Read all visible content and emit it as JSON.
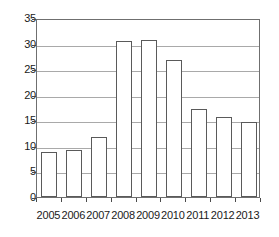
{
  "chart_data": {
    "type": "bar",
    "title": "",
    "subtitle": "",
    "xlabel": "",
    "ylabel": "",
    "categories": [
      "2005",
      "2006",
      "2007",
      "2008",
      "2009",
      "2010",
      "2011",
      "2012",
      "2013"
    ],
    "values": [
      8.8,
      9.2,
      11.7,
      30.5,
      30.7,
      26.7,
      17.2,
      15.6,
      14.6
    ],
    "ylim": [
      0,
      35
    ],
    "yticks": [
      0,
      5,
      10,
      15,
      20,
      25,
      30,
      35
    ],
    "ytick_labels": [
      "0",
      "5",
      "10",
      "15",
      "20",
      "25",
      "30",
      "35"
    ],
    "grid": true,
    "grid_axis": "y",
    "legend": false,
    "legend_position": "none",
    "bar_fill_color": "#ffffff",
    "bar_edge_color": "#5a5a5a",
    "gridline_color": "#a9a9a9",
    "frame_color": "#6f6f6f",
    "text_color": "#1a1a1a",
    "annotations": []
  }
}
